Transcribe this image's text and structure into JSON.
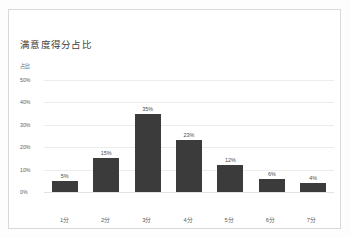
{
  "card": {
    "title": "满意度得分占比"
  },
  "chart_data": {
    "type": "bar",
    "title": "满意度得分占比",
    "xlabel": "",
    "ylabel": "占比",
    "categories": [
      "1分",
      "2分",
      "3分",
      "4分",
      "5分",
      "6分",
      "7分"
    ],
    "values": [
      5,
      15,
      35,
      23,
      12,
      6,
      4
    ],
    "value_labels": [
      "5%",
      "15%",
      "35%",
      "23%",
      "12%",
      "6%",
      "4%"
    ],
    "ytick_labels": [
      "50%",
      "40%",
      "30%",
      "20%",
      "10%",
      "0%"
    ],
    "ytick_values": [
      50,
      40,
      30,
      20,
      10,
      0
    ],
    "ylim": [
      0,
      50
    ],
    "grid": true,
    "legend": false,
    "series_color": "#3b3b3b"
  }
}
